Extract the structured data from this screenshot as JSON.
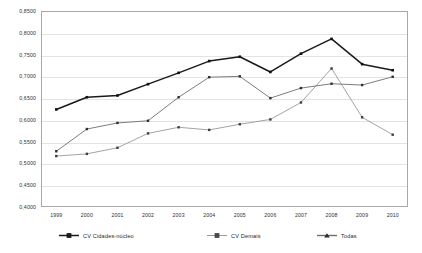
{
  "chart_data": {
    "type": "line",
    "title": "",
    "xlabel": "",
    "ylabel": "",
    "ylim": [
      0.4,
      0.85
    ],
    "ytick_step": 0.05,
    "grid": "horizontal",
    "legend_position": "bottom",
    "decimal_separator": ",",
    "categories": [
      "1999",
      "2000",
      "2001",
      "2002",
      "2003",
      "2004",
      "2005",
      "2006",
      "2007",
      "2008",
      "2009",
      "2010"
    ],
    "x": [
      1999,
      2000,
      2001,
      2002,
      2003,
      2004,
      2005,
      2006,
      2007,
      2008,
      2009,
      2010
    ],
    "ytick_labels": [
      "0,8500",
      "0,8000",
      "0,7500",
      "0,7000",
      "0,6500",
      "0,6000",
      "0,5500",
      "0,5000",
      "0,4500",
      "0,4000"
    ],
    "ytick_values": [
      0.85,
      0.8,
      0.75,
      0.7,
      0.65,
      0.6,
      0.55,
      0.5,
      0.45,
      0.4
    ],
    "series": [
      {
        "name": "CV Cidades-núcleo",
        "color": "#1a1a1a",
        "line_width": 1.5,
        "marker": "square",
        "values": [
          0.624,
          0.652,
          0.656,
          0.682,
          0.708,
          0.735,
          0.745,
          0.71,
          0.752,
          0.786,
          0.728,
          0.714
        ]
      },
      {
        "name": "CV Demais",
        "color": "#9a9a9a",
        "line_width": 0.9,
        "marker": "square",
        "values": [
          0.517,
          0.522,
          0.536,
          0.569,
          0.583,
          0.577,
          0.59,
          0.601,
          0.64,
          0.718,
          0.606,
          0.566
        ]
      },
      {
        "name": "Todas",
        "color": "#6e6e6e",
        "line_width": 0.9,
        "marker": "square",
        "values": [
          0.528,
          0.579,
          0.593,
          0.598,
          0.652,
          0.698,
          0.7,
          0.65,
          0.673,
          0.683,
          0.68,
          0.699
        ]
      }
    ]
  },
  "legend": {
    "items": [
      {
        "label": "CV Cidades-núcleo"
      },
      {
        "label": "CV Demais"
      },
      {
        "label": "Todas"
      }
    ]
  }
}
